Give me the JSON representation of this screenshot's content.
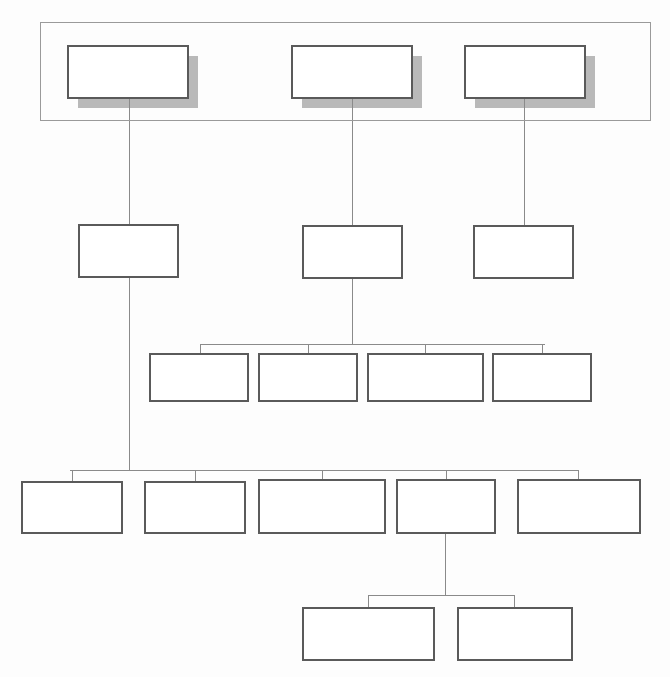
{
  "diagram": {
    "type": "organizational-hierarchy-chart",
    "title": "",
    "background_color": "#fdfdfd",
    "box_fill": "#ffffff",
    "box_stroke": "#5a5a5a",
    "shadow_color": "#b9b9b9",
    "connector_color": "#8a8a8a",
    "group_frame_color": "#9a9a9a",
    "all_boxes_empty": true,
    "group_frame": {
      "x": 40,
      "y": 22,
      "width": 610,
      "height": 98,
      "label": ""
    },
    "levels": [
      {
        "level": 1,
        "name": "top-level",
        "has_shadow": true,
        "nodes": [
          {
            "id": "n1-1",
            "label": "",
            "x": 68,
            "y": 46,
            "width": 120,
            "height": 52
          },
          {
            "id": "n1-2",
            "label": "",
            "x": 292,
            "y": 46,
            "width": 120,
            "height": 52
          },
          {
            "id": "n1-3",
            "label": "",
            "x": 465,
            "y": 46,
            "width": 120,
            "height": 52
          }
        ]
      },
      {
        "level": 2,
        "name": "second-level",
        "has_shadow": false,
        "nodes": [
          {
            "id": "n2-1",
            "label": "",
            "x": 79,
            "y": 225,
            "width": 99,
            "height": 52
          },
          {
            "id": "n2-2",
            "label": "",
            "x": 303,
            "y": 226,
            "width": 99,
            "height": 52
          },
          {
            "id": "n2-3",
            "label": "",
            "x": 474,
            "y": 226,
            "width": 99,
            "height": 52
          }
        ]
      },
      {
        "level": 3,
        "name": "third-level",
        "has_shadow": false,
        "bus_y": 344,
        "bus_x1": 200,
        "bus_x2": 545,
        "nodes": [
          {
            "id": "n3-1",
            "label": "",
            "x": 150,
            "y": 354,
            "width": 98,
            "height": 47
          },
          {
            "id": "n3-2",
            "label": "",
            "x": 259,
            "y": 354,
            "width": 98,
            "height": 47
          },
          {
            "id": "n3-3",
            "label": "",
            "x": 368,
            "y": 354,
            "width": 115,
            "height": 47
          },
          {
            "id": "n3-4",
            "label": "",
            "x": 493,
            "y": 354,
            "width": 98,
            "height": 47
          }
        ]
      },
      {
        "level": 4,
        "name": "fourth-level",
        "has_shadow": false,
        "bus_y": 470,
        "bus_x1": 70,
        "bus_x2": 578,
        "nodes": [
          {
            "id": "n4-1",
            "label": "",
            "x": 22,
            "y": 482,
            "width": 100,
            "height": 51
          },
          {
            "id": "n4-2",
            "label": "",
            "x": 145,
            "y": 482,
            "width": 100,
            "height": 51
          },
          {
            "id": "n4-3",
            "label": "",
            "x": 259,
            "y": 480,
            "width": 126,
            "height": 53
          },
          {
            "id": "n4-4",
            "label": "",
            "x": 397,
            "y": 480,
            "width": 98,
            "height": 53
          },
          {
            "id": "n4-5",
            "label": "",
            "x": 518,
            "y": 480,
            "width": 122,
            "height": 53
          }
        ]
      },
      {
        "level": 5,
        "name": "fifth-level",
        "has_shadow": false,
        "bus_y": 595,
        "bus_x1": 368,
        "bus_x2": 514,
        "nodes": [
          {
            "id": "n5-1",
            "label": "",
            "x": 303,
            "y": 608,
            "width": 131,
            "height": 52
          },
          {
            "id": "n5-2",
            "label": "",
            "x": 458,
            "y": 608,
            "width": 114,
            "height": 52
          }
        ]
      }
    ],
    "connectors": [
      {
        "id": "c-n1-1",
        "from": "n1-1",
        "to": "n2-1",
        "kind": "vertical",
        "x": 129,
        "y1": 98,
        "y2": 225
      },
      {
        "id": "c-n1-2",
        "from": "n1-2",
        "to": "n2-2",
        "kind": "vertical",
        "x": 352,
        "y1": 98,
        "y2": 226
      },
      {
        "id": "c-n1-3",
        "from": "n1-3",
        "to": "n2-3",
        "kind": "vertical",
        "x": 524,
        "y1": 98,
        "y2": 226
      },
      {
        "id": "c-n2-1-down",
        "from": "n2-1",
        "to": "bus-4",
        "kind": "vertical",
        "x": 129,
        "y1": 277,
        "y2": 470
      },
      {
        "id": "c-n2-2-down",
        "from": "n2-2",
        "to": "bus-3",
        "kind": "vertical",
        "x": 352,
        "y1": 278,
        "y2": 344
      },
      {
        "id": "c-n4-4-down",
        "from": "n4-4",
        "to": "bus-5",
        "kind": "vertical",
        "x": 445,
        "y1": 533,
        "y2": 595
      }
    ]
  }
}
